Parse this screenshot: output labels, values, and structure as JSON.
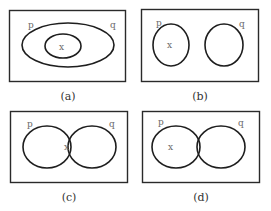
{
  "panels": [
    {
      "id": "a",
      "caption": "(a)",
      "set_labels": {
        "p": "p",
        "q": "q"
      },
      "element_label": "x",
      "relation": "inner set p nested inside set q; x in inner set"
    },
    {
      "id": "b",
      "caption": "(b)",
      "set_labels": {
        "p": "p",
        "q": "q"
      },
      "element_label": "x",
      "relation": "disjoint sets p and q; x in p"
    },
    {
      "id": "c",
      "caption": "(c)",
      "set_labels": {
        "p": "p",
        "q": "q"
      },
      "element_label": "x",
      "relation": "overlapping sets p and q; x in intersection"
    },
    {
      "id": "d",
      "caption": "(d)",
      "set_labels": {
        "p": "p",
        "q": "q"
      },
      "element_label": "x",
      "relation": "overlapping sets p and q; x in p only"
    }
  ],
  "colors": {
    "stroke": "#1e1e1e",
    "label": "#6a6a6a",
    "caption": "#333333",
    "background": "#ffffff"
  }
}
